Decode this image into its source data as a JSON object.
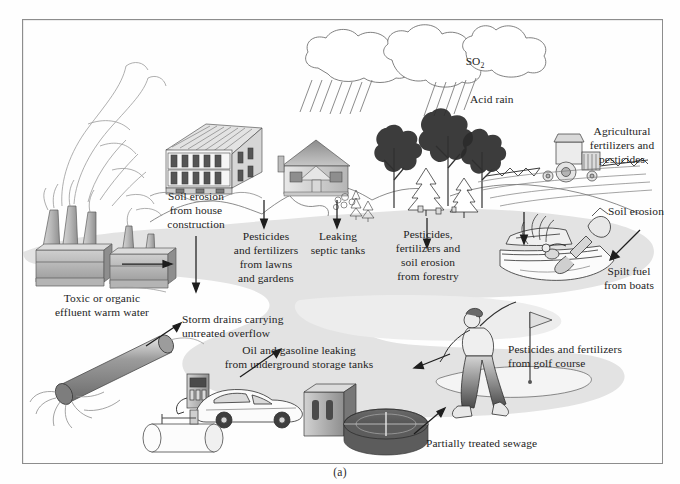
{
  "figure": {
    "caption": "(a)"
  },
  "labels": {
    "so2": "SO2",
    "acid_rain": "Acid rain",
    "agricultural": "Agricultural\nfertilizers and\npesticides",
    "soil_erosion": "Soil erosion",
    "spilt_fuel": "Spilt fuel\nfrom boats",
    "forestry": "Pesticides,\nfertilizers and\nsoil erosion\nfrom forestry",
    "septic": "Leaking\nseptic tanks",
    "lawns": "Pesticides\nand fertilizers\nfrom lawns\nand gardens",
    "house_construction": "Soil erosion\nfrom house\nconstruction",
    "effluent": "Toxic or organic\neffluent warm water",
    "storm_drains": "Storm drains carrying\nuntreated overflow",
    "oil_gasoline": "Oil and gasoline leaking\nfrom underground storage tanks",
    "golf": "Pesticides and fertilizers\nfrom golf course",
    "sewage": "Partially treated sewage"
  },
  "icons": {
    "cloud": "cloud-icon",
    "rain": "rain-icon",
    "factory": "factory-icon",
    "apartment": "apartment-building-icon",
    "house": "suburban-house-icon",
    "trees": "forest-trees-icon",
    "tractor": "tractor-icon",
    "boat": "motorboat-icon",
    "golfer": "golfer-icon",
    "outfall_pipe": "outfall-pipe-icon",
    "gas_station": "gas-station-icon",
    "car": "car-icon",
    "storage_tank": "underground-storage-tank-icon",
    "treatment_plant": "sewage-treatment-plant-icon",
    "arrow": "arrow-icon"
  },
  "colors": {
    "water": "#e2e2e2",
    "ink": "#1d1d1d",
    "frame": "#8d8d8d",
    "shade_light": "#d6d6d6",
    "shade_mid": "#a8a8a8",
    "shade_dark": "#6e6e6e",
    "page": "#fefefe"
  }
}
